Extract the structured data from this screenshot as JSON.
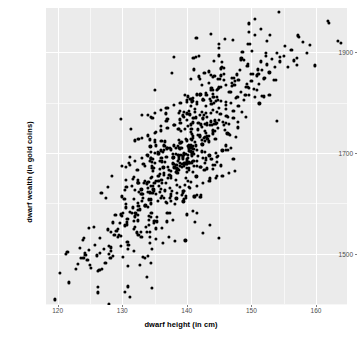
{
  "chart_data": {
    "type": "scatter",
    "title": "",
    "xlabel": "dwarf height (in cm)",
    "ylabel": "dwarf wealth (in gold coins)",
    "xlim": [
      118.2,
      164.8
    ],
    "ylim": [
      1398,
      1988
    ],
    "xticks": [
      120,
      130,
      140,
      150,
      160
    ],
    "yticks": [
      1500,
      1700,
      1900
    ],
    "xtick_labels": [
      "120",
      "130",
      "140",
      "150",
      "160"
    ],
    "ytick_labels": [
      "1500",
      "1700",
      "1900"
    ],
    "x_minor_ticks": [
      125,
      135,
      145,
      155
    ],
    "y_minor_ticks": [
      1400,
      1600,
      1800,
      1900
    ],
    "grid": true,
    "legend": null,
    "n_points": 702,
    "marker": {
      "shape": "circle",
      "color": "#000000",
      "size_px": 3.2
    },
    "panel_background": "#ebebeb",
    "gridline_color": "#ffffff",
    "correlation": "strong positive",
    "points": [
      [
        119.6,
        1409
      ],
      [
        121.5,
        1504
      ],
      [
        121.7,
        1443
      ],
      [
        120.3,
        1462
      ],
      [
        122.8,
        1469
      ],
      [
        123.1,
        1480
      ],
      [
        124.0,
        1491
      ],
      [
        124.3,
        1498
      ],
      [
        124.6,
        1487
      ],
      [
        124.2,
        1502
      ],
      [
        124.8,
        1551
      ],
      [
        125.6,
        1553
      ],
      [
        123.9,
        1528
      ],
      [
        124.1,
        1532
      ],
      [
        125.0,
        1477
      ],
      [
        126.2,
        1465
      ],
      [
        126.8,
        1470
      ],
      [
        127.4,
        1482
      ],
      [
        127.9,
        1515
      ],
      [
        128.3,
        1506
      ],
      [
        128.8,
        1538
      ],
      [
        129.1,
        1545
      ],
      [
        129.6,
        1561
      ],
      [
        130.0,
        1575
      ],
      [
        130.4,
        1556
      ],
      [
        130.8,
        1569
      ],
      [
        131.2,
        1583
      ],
      [
        131.6,
        1592
      ],
      [
        132.0,
        1574
      ],
      [
        132.4,
        1601
      ],
      [
        132.8,
        1588
      ],
      [
        133.2,
        1610
      ],
      [
        133.6,
        1596
      ],
      [
        134.0,
        1622
      ],
      [
        134.4,
        1607
      ],
      [
        134.8,
        1634
      ],
      [
        135.2,
        1618
      ],
      [
        135.6,
        1645
      ],
      [
        136.0,
        1629
      ],
      [
        136.4,
        1656
      ],
      [
        136.8,
        1640
      ],
      [
        137.2,
        1667
      ],
      [
        137.6,
        1651
      ],
      [
        138.0,
        1678
      ],
      [
        138.4,
        1662
      ],
      [
        138.8,
        1689
      ],
      [
        139.2,
        1673
      ],
      [
        139.6,
        1700
      ],
      [
        140.0,
        1684
      ],
      [
        140.4,
        1711
      ],
      [
        140.8,
        1695
      ],
      [
        141.2,
        1722
      ],
      [
        141.6,
        1706
      ],
      [
        142.0,
        1733
      ],
      [
        142.4,
        1717
      ],
      [
        142.8,
        1744
      ],
      [
        143.2,
        1728
      ],
      [
        143.6,
        1755
      ],
      [
        144.0,
        1739
      ],
      [
        144.4,
        1766
      ],
      [
        144.8,
        1750
      ],
      [
        145.2,
        1777
      ],
      [
        145.6,
        1761
      ],
      [
        146.0,
        1788
      ],
      [
        146.4,
        1772
      ],
      [
        146.8,
        1799
      ],
      [
        147.2,
        1783
      ],
      [
        147.6,
        1810
      ],
      [
        148.0,
        1794
      ],
      [
        148.4,
        1821
      ],
      [
        148.8,
        1805
      ],
      [
        149.2,
        1832
      ],
      [
        149.6,
        1816
      ],
      [
        150.0,
        1843
      ],
      [
        150.4,
        1827
      ],
      [
        150.8,
        1854
      ],
      [
        151.2,
        1838
      ],
      [
        151.6,
        1865
      ],
      [
        152.0,
        1849
      ],
      [
        152.4,
        1876
      ],
      [
        152.8,
        1860
      ],
      [
        153.2,
        1887
      ],
      [
        153.6,
        1871
      ],
      [
        154.0,
        1898
      ],
      [
        154.4,
        1882
      ],
      [
        155.0,
        1893
      ],
      [
        155.6,
        1871
      ],
      [
        156.2,
        1905
      ],
      [
        157.0,
        1889
      ],
      [
        158.0,
        1920
      ],
      [
        158.6,
        1898
      ],
      [
        159.8,
        1874
      ],
      [
        161.8,
        1962
      ],
      [
        163.4,
        1923
      ],
      [
        163.8,
        1918
      ],
      [
        162.0,
        1958
      ],
      [
        159.0,
        1915
      ],
      [
        157.4,
        1931
      ],
      [
        156.6,
        1884
      ],
      [
        155.2,
        1912
      ],
      [
        153.8,
        1845
      ],
      [
        152.2,
        1893
      ],
      [
        151.0,
        1866
      ],
      [
        150.6,
        1811
      ],
      [
        149.4,
        1877
      ],
      [
        148.6,
        1900
      ],
      [
        147.8,
        1856
      ],
      [
        146.6,
        1822
      ],
      [
        145.8,
        1869
      ],
      [
        144.6,
        1812
      ],
      [
        143.8,
        1798
      ],
      [
        142.6,
        1776
      ],
      [
        141.8,
        1760
      ],
      [
        140.6,
        1742
      ],
      [
        139.8,
        1728
      ],
      [
        138.6,
        1714
      ],
      [
        137.8,
        1698
      ],
      [
        136.6,
        1682
      ],
      [
        135.8,
        1668
      ],
      [
        134.6,
        1652
      ],
      [
        133.8,
        1638
      ],
      [
        132.6,
        1622
      ],
      [
        131.8,
        1608
      ],
      [
        130.6,
        1592
      ],
      [
        129.8,
        1578
      ],
      [
        128.6,
        1562
      ],
      [
        127.8,
        1548
      ],
      [
        126.6,
        1532
      ],
      [
        125.8,
        1518
      ],
      [
        124.9,
        1508
      ],
      [
        135.0,
        1700
      ],
      [
        136.0,
        1705
      ],
      [
        137.0,
        1710
      ],
      [
        138.0,
        1715
      ],
      [
        139.0,
        1720
      ],
      [
        140.0,
        1725
      ],
      [
        141.0,
        1730
      ],
      [
        142.0,
        1735
      ],
      [
        143.0,
        1740
      ],
      [
        144.0,
        1745
      ],
      [
        134.0,
        1695
      ],
      [
        133.0,
        1690
      ],
      [
        132.0,
        1685
      ],
      [
        131.0,
        1680
      ],
      [
        130.0,
        1675
      ],
      [
        136.5,
        1660
      ],
      [
        137.5,
        1665
      ],
      [
        138.5,
        1670
      ],
      [
        139.5,
        1675
      ],
      [
        140.5,
        1680
      ],
      [
        141.5,
        1685
      ],
      [
        142.5,
        1690
      ],
      [
        143.5,
        1695
      ],
      [
        144.5,
        1700
      ],
      [
        145.5,
        1705
      ],
      [
        135.5,
        1655
      ],
      [
        134.5,
        1650
      ],
      [
        133.5,
        1645
      ],
      [
        132.5,
        1640
      ],
      [
        131.5,
        1635
      ],
      [
        137.0,
        1750
      ],
      [
        138.0,
        1755
      ],
      [
        139.0,
        1760
      ],
      [
        140.0,
        1765
      ],
      [
        141.0,
        1770
      ],
      [
        142.0,
        1775
      ],
      [
        143.0,
        1780
      ],
      [
        144.0,
        1785
      ],
      [
        145.0,
        1790
      ],
      [
        146.0,
        1795
      ],
      [
        136.0,
        1745
      ],
      [
        135.0,
        1740
      ],
      [
        134.0,
        1735
      ],
      [
        133.0,
        1730
      ],
      [
        132.0,
        1725
      ],
      [
        138.5,
        1620
      ],
      [
        139.5,
        1625
      ],
      [
        140.5,
        1630
      ],
      [
        141.5,
        1635
      ],
      [
        142.5,
        1640
      ],
      [
        137.5,
        1615
      ],
      [
        136.5,
        1610
      ],
      [
        135.5,
        1605
      ],
      [
        134.5,
        1600
      ],
      [
        133.5,
        1595
      ],
      [
        143.5,
        1645
      ],
      [
        144.5,
        1650
      ],
      [
        145.5,
        1655
      ],
      [
        146.5,
        1660
      ],
      [
        147.5,
        1665
      ],
      [
        139.0,
        1800
      ],
      [
        140.0,
        1805
      ],
      [
        141.0,
        1810
      ],
      [
        142.0,
        1815
      ],
      [
        143.0,
        1820
      ],
      [
        144.0,
        1825
      ],
      [
        145.0,
        1830
      ],
      [
        146.0,
        1835
      ],
      [
        147.0,
        1840
      ],
      [
        148.0,
        1845
      ],
      [
        138.0,
        1795
      ],
      [
        137.0,
        1790
      ],
      [
        136.0,
        1785
      ],
      [
        135.0,
        1780
      ],
      [
        134.0,
        1775
      ]
    ]
  },
  "axes": {
    "x_title": "dwarf height (in cm)",
    "y_title": "dwarf wealth (in gold coins)"
  }
}
